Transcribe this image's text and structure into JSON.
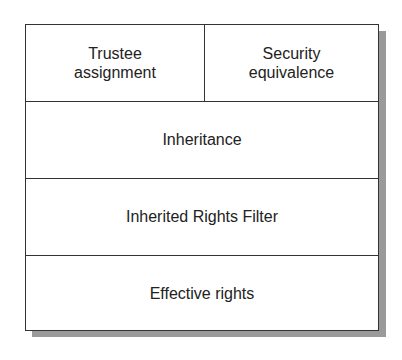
{
  "diagram": {
    "top_row": {
      "left": {
        "line1": "Trustee",
        "line2": "assignment"
      },
      "right": {
        "line1": "Security",
        "line2": "equivalence"
      }
    },
    "rows": [
      {
        "label": "Inheritance"
      },
      {
        "label": "Inherited Rights Filter"
      },
      {
        "label": "Effective rights"
      }
    ]
  }
}
